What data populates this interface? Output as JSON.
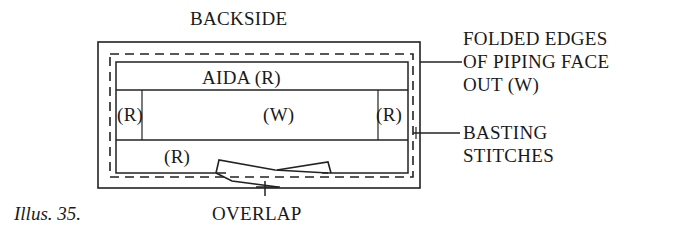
{
  "diagram": {
    "title": "BACKSIDE",
    "center_top_label": "AIDA (R)",
    "left_label": "(R)",
    "center_label": "(W)",
    "right_label": "(R)",
    "bottom_left_label": "(R)",
    "callouts": {
      "folded_edges": [
        "FOLDED EDGES",
        "OF PIPING FACE",
        "OUT (W)"
      ],
      "basting": [
        "BASTING",
        "STITCHES"
      ],
      "overlap": "OVERLAP"
    },
    "caption": "Illus. 35."
  }
}
